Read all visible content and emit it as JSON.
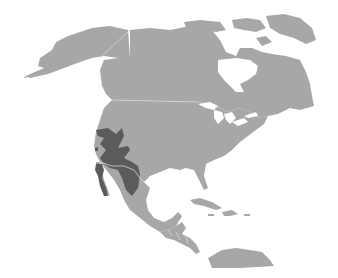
{
  "map": {
    "region": "North America",
    "style": "grayscale",
    "colors": {
      "background": "#ffffff",
      "land": "#a7a7a7",
      "highlighted_range": "#5b5b5b",
      "borders": "#d6d6d6"
    },
    "highlighted_area": "Southwestern United States and northwestern Mexico (including Baja California peninsula)",
    "labels": []
  }
}
